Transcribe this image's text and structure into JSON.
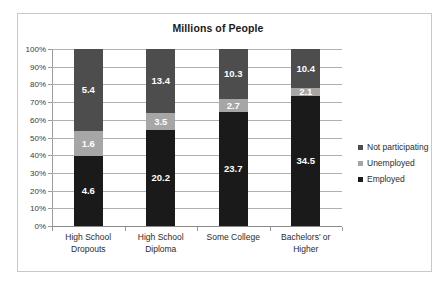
{
  "frame": {
    "border_color": "#c8c8c8",
    "background": "#ffffff"
  },
  "chart_data": {
    "type": "bar",
    "subtype": "stacked-100-percent",
    "title": "Millions of People",
    "xlabel": "",
    "ylabel": "",
    "ylim": [
      0,
      100
    ],
    "ytick_labels": [
      "100%",
      "90%",
      "80%",
      "70%",
      "60%",
      "50%",
      "40%",
      "30%",
      "20%",
      "10%",
      "0%"
    ],
    "ytick_values": [
      100,
      90,
      80,
      70,
      60,
      50,
      40,
      30,
      20,
      10,
      0
    ],
    "grid": true,
    "legend_position": "right",
    "categories": [
      "High School Dropouts",
      "High School Diploma",
      "Some College",
      "Bachelors' or Higher"
    ],
    "category_lines": [
      [
        "High School",
        "Dropouts"
      ],
      [
        "High School",
        "Diploma"
      ],
      [
        "Some College",
        ""
      ],
      [
        "Bachelors' or",
        "Higher"
      ]
    ],
    "series": [
      {
        "name": "Employed",
        "color": "#1a1a1a",
        "values": [
          4.6,
          20.2,
          23.7,
          34.5
        ],
        "labels": [
          "4.6",
          "20.2",
          "23.7",
          "34.5"
        ],
        "percents": [
          39.7,
          54.3,
          64.5,
          73.4
        ]
      },
      {
        "name": "Unemployed",
        "color": "#a6a6a6",
        "values": [
          1.6,
          3.5,
          2.7,
          2.1
        ],
        "labels": [
          "1.6",
          "3.5",
          "2.7",
          "2.1"
        ],
        "percents": [
          13.8,
          9.4,
          7.3,
          4.5
        ]
      },
      {
        "name": "Not participating",
        "color": "#4d4d4d",
        "values": [
          5.4,
          13.4,
          10.3,
          10.4
        ],
        "labels": [
          "5.4",
          "13.4",
          "10.3",
          "10.4"
        ],
        "percents": [
          46.5,
          36.3,
          28.2,
          22.1
        ]
      }
    ],
    "legend_entries": [
      {
        "label": "Not participating",
        "color": "#4d4d4d"
      },
      {
        "label": "Unemployed",
        "color": "#a6a6a6"
      },
      {
        "label": "Employed",
        "color": "#1a1a1a"
      }
    ]
  }
}
